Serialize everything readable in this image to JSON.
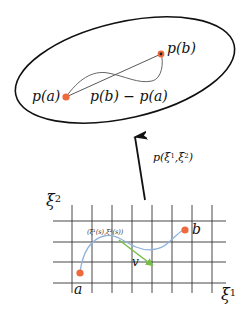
{
  "figure": {
    "manifold": {
      "label_pa": "p(a)",
      "label_pb": "p(b)",
      "label_diff": "p(b) − p(a)"
    },
    "mapping": {
      "label_prefix": "p(ξ",
      "label_sup1": "1",
      "label_mid": ",ξ",
      "label_sup2": "2",
      "label_suffix": ")"
    },
    "parameter_space": {
      "axis_y_base": "ξ",
      "axis_y_sup": "2",
      "axis_x_base": "ξ",
      "axis_x_sup": "1",
      "point_a": "a",
      "point_b": "b",
      "tangent_label": "v",
      "curve_point_label": "(ξ¹(s),ξ²(s))",
      "grid": {
        "vertical_lines": 8,
        "horizontal_lines": 4
      }
    },
    "colors": {
      "point": "#ee6a3c",
      "curve_param": "#8fb4dc",
      "tangent": "#74bf45",
      "ellipse": "#111111",
      "grid": "#333333",
      "manifold_curve": "#555555"
    }
  }
}
